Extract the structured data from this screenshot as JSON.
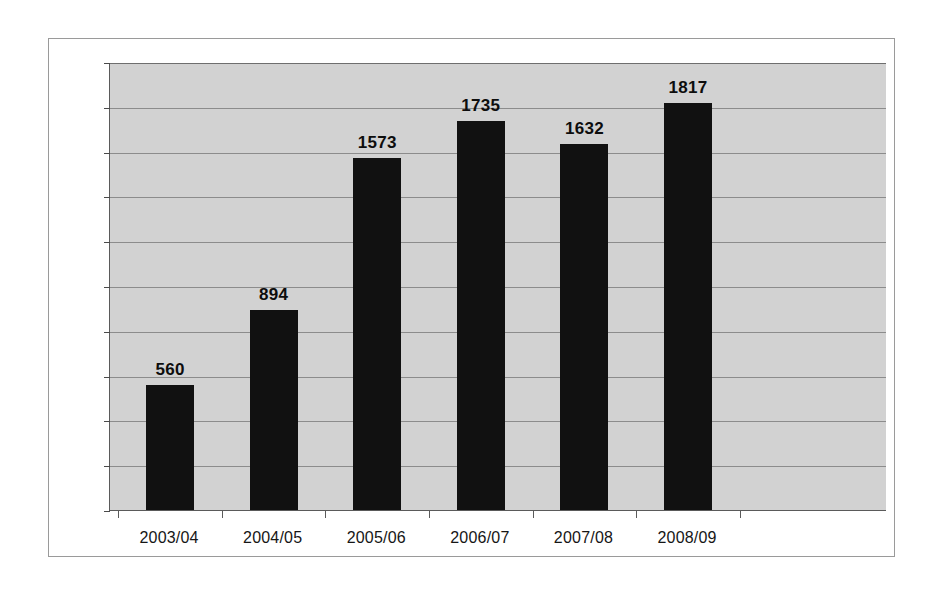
{
  "chart_data": {
    "type": "bar",
    "title": "",
    "subtitle": "",
    "xlabel": "",
    "ylabel": "",
    "categories": [
      "2003/04",
      "2004/05",
      "2005/06",
      "2006/07",
      "2007/08",
      "2008/09"
    ],
    "values": [
      560,
      894,
      1573,
      1735,
      1632,
      1817
    ],
    "data_labels": [
      "560",
      "894",
      "1573",
      "1735",
      "1632",
      "1817"
    ],
    "ylim": [
      0,
      2000
    ],
    "ytick_step": 200,
    "ytick_labels": [
      "0",
      "200",
      "400",
      "600",
      "800",
      "1000",
      "1200",
      "1400",
      "1600",
      "1800",
      "2000"
    ],
    "ytick_values": [
      0,
      200,
      400,
      600,
      800,
      1000,
      1200,
      1400,
      1600,
      1800,
      2000
    ],
    "grid": true,
    "grid_axis": "y",
    "legend": false,
    "legend_position": "none",
    "colors": {
      "bar": "#111111",
      "plot_background": "#d2d2d2",
      "gridline": "#8c8c8c",
      "axis": "#5a5a5a",
      "frame_border": "#9a9a9a",
      "page_background": "#ffffff",
      "label_text": "#0d0d0d"
    }
  }
}
